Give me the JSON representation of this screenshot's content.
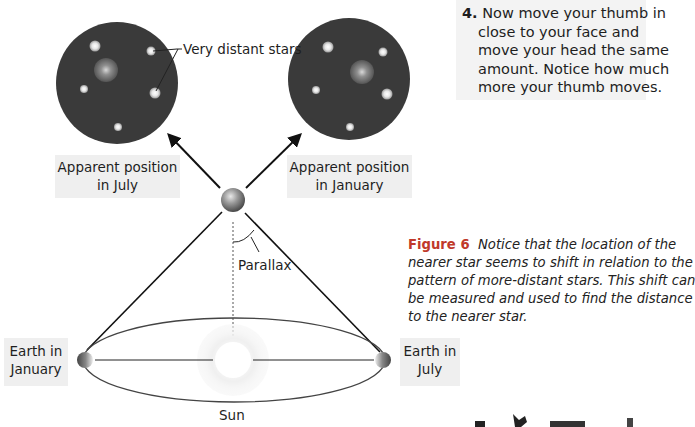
{
  "step": {
    "number": "4.",
    "lines": [
      "Now move your thumb in",
      "close to your face and",
      "move your head the same",
      "amount. Notice how much",
      "more your thumb moves."
    ]
  },
  "labels": {
    "very_distant_stars": "Very distant stars",
    "apparent_july_line1": "Apparent position",
    "apparent_july_line2": "in July",
    "apparent_january_line1": "Apparent position",
    "apparent_january_line2": "in January",
    "parallax": "Parallax",
    "earth_january_line1": "Earth in",
    "earth_january_line2": "January",
    "earth_july_line1": "Earth in",
    "earth_july_line2": "July",
    "sun": "Sun"
  },
  "caption": {
    "figure_label": "Figure 6",
    "lines": [
      "Notice that the location of the",
      "nearer star seems to shift in relation to the",
      "pattern of more-distant stars. This shift can",
      "be measured and used to find the distance",
      "to the nearer star."
    ]
  },
  "colors": {
    "sky_disc": "#3a3a3a",
    "figure_label": "#c0392b",
    "label_bg": "#efefef",
    "orbit": "#444444"
  }
}
